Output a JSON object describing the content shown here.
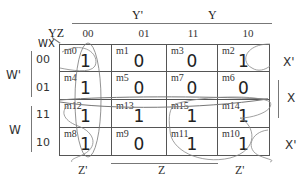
{
  "title_vars": {
    "col_vars": "YZ",
    "row_vars": "WX"
  },
  "top_labels": {
    "y_prime": "Y'",
    "y": "Y"
  },
  "column_headers": [
    "00",
    "01",
    "11",
    "10"
  ],
  "row_headers": [
    "00",
    "01",
    "11",
    "10"
  ],
  "left_labels": {
    "w_prime": "W'",
    "w": "W"
  },
  "right_labels": {
    "x_prime_top": "X'",
    "x": "X",
    "x_prime_bottom": "X'"
  },
  "bottom_labels": {
    "z_prime_left": "Z'",
    "z": "Z",
    "z_prime_right": "Z'"
  },
  "cells": [
    [
      {
        "m": "m0",
        "v": "1"
      },
      {
        "m": "m1",
        "v": "0"
      },
      {
        "m": "m3",
        "v": "0"
      },
      {
        "m": "m2",
        "v": "1"
      }
    ],
    [
      {
        "m": "m4",
        "v": "1"
      },
      {
        "m": "m5",
        "v": "0"
      },
      {
        "m": "m7",
        "v": "0"
      },
      {
        "m": "m6",
        "v": "0"
      }
    ],
    [
      {
        "m": "m12",
        "v": "1"
      },
      {
        "m": "m13",
        "v": "1"
      },
      {
        "m": "m15",
        "v": "1"
      },
      {
        "m": "m14",
        "v": "1"
      }
    ],
    [
      {
        "m": "m8",
        "v": "1"
      },
      {
        "m": "m9",
        "v": "0"
      },
      {
        "m": "m11",
        "v": "1"
      },
      {
        "m": "m10",
        "v": "1"
      }
    ]
  ]
}
